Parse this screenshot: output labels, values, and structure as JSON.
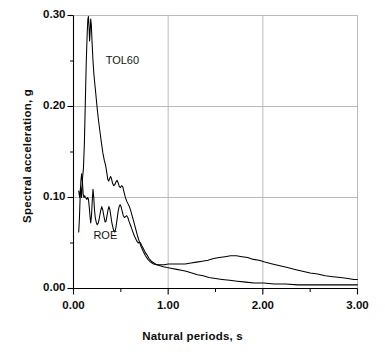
{
  "chart_data": {
    "type": "line",
    "title": "",
    "xlabel": "Natural periods, s",
    "ylabel": "Spectral acceleration, g",
    "xlim": [
      0.0,
      3.0
    ],
    "ylim": [
      0.0,
      0.3
    ],
    "xticks": [
      0.0,
      1.0,
      2.0,
      3.0
    ],
    "xtick_labels": [
      "0.00",
      "1.00",
      "2.00",
      "3.00"
    ],
    "xminorticks": [
      0.5,
      1.5,
      2.5
    ],
    "yticks": [
      0.0,
      0.1,
      0.2,
      0.3
    ],
    "ytick_labels": [
      "0.00",
      "0.10",
      "0.20",
      "0.30"
    ],
    "yminorticks": [
      0.05,
      0.15,
      0.25
    ],
    "grid": true,
    "grid_color": "#b3b3b3",
    "line_color": "#000000",
    "legend_position": "inline-annotations",
    "annotations": [
      {
        "text": "TOL60",
        "x": 0.34,
        "y": 0.249
      },
      {
        "text": "ROE",
        "x": 0.21,
        "y": 0.057
      }
    ],
    "series": [
      {
        "name": "TOL60",
        "color": "#000000",
        "points": [
          [
            0.055,
            0.107
          ],
          [
            0.065,
            0.1
          ],
          [
            0.075,
            0.112
          ],
          [
            0.085,
            0.1
          ],
          [
            0.095,
            0.121
          ],
          [
            0.105,
            0.132
          ],
          [
            0.115,
            0.16
          ],
          [
            0.125,
            0.205
          ],
          [
            0.135,
            0.25
          ],
          [
            0.145,
            0.281
          ],
          [
            0.152,
            0.296
          ],
          [
            0.158,
            0.299
          ],
          [
            0.164,
            0.288
          ],
          [
            0.17,
            0.272
          ],
          [
            0.176,
            0.283
          ],
          [
            0.182,
            0.296
          ],
          [
            0.188,
            0.29
          ],
          [
            0.196,
            0.271
          ],
          [
            0.205,
            0.252
          ],
          [
            0.215,
            0.236
          ],
          [
            0.228,
            0.222
          ],
          [
            0.24,
            0.209
          ],
          [
            0.252,
            0.196
          ],
          [
            0.265,
            0.184
          ],
          [
            0.28,
            0.172
          ],
          [
            0.295,
            0.16
          ],
          [
            0.31,
            0.149
          ],
          [
            0.325,
            0.141
          ],
          [
            0.34,
            0.135
          ],
          [
            0.352,
            0.127
          ],
          [
            0.362,
            0.12
          ],
          [
            0.372,
            0.118
          ],
          [
            0.382,
            0.121
          ],
          [
            0.392,
            0.123
          ],
          [
            0.4,
            0.121
          ],
          [
            0.412,
            0.116
          ],
          [
            0.424,
            0.113
          ],
          [
            0.436,
            0.114
          ],
          [
            0.448,
            0.117
          ],
          [
            0.46,
            0.119
          ],
          [
            0.472,
            0.116
          ],
          [
            0.484,
            0.112
          ],
          [
            0.496,
            0.111
          ],
          [
            0.508,
            0.113
          ],
          [
            0.52,
            0.112
          ],
          [
            0.534,
            0.106
          ],
          [
            0.548,
            0.1
          ],
          [
            0.562,
            0.096
          ],
          [
            0.576,
            0.093
          ],
          [
            0.59,
            0.09
          ],
          [
            0.606,
            0.085
          ],
          [
            0.622,
            0.079
          ],
          [
            0.64,
            0.072
          ],
          [
            0.658,
            0.065
          ],
          [
            0.676,
            0.058
          ],
          [
            0.694,
            0.052
          ],
          [
            0.714,
            0.046
          ],
          [
            0.736,
            0.041
          ],
          [
            0.76,
            0.036
          ],
          [
            0.786,
            0.032
          ],
          [
            0.814,
            0.029
          ],
          [
            0.846,
            0.027
          ],
          [
            0.88,
            0.026
          ],
          [
            0.92,
            0.026
          ],
          [
            0.96,
            0.026
          ],
          [
            1.0,
            0.027
          ],
          [
            1.06,
            0.027
          ],
          [
            1.12,
            0.027
          ],
          [
            1.18,
            0.027
          ],
          [
            1.24,
            0.028
          ],
          [
            1.3,
            0.029
          ],
          [
            1.36,
            0.03
          ],
          [
            1.42,
            0.031
          ],
          [
            1.48,
            0.033
          ],
          [
            1.54,
            0.034
          ],
          [
            1.6,
            0.035
          ],
          [
            1.66,
            0.036
          ],
          [
            1.72,
            0.036
          ],
          [
            1.78,
            0.035
          ],
          [
            1.84,
            0.034
          ],
          [
            1.9,
            0.032
          ],
          [
            1.96,
            0.031
          ],
          [
            2.02,
            0.029
          ],
          [
            2.1,
            0.027
          ],
          [
            2.18,
            0.025
          ],
          [
            2.26,
            0.023
          ],
          [
            2.34,
            0.021
          ],
          [
            2.42,
            0.019
          ],
          [
            2.5,
            0.017
          ],
          [
            2.58,
            0.016
          ],
          [
            2.66,
            0.014
          ],
          [
            2.74,
            0.013
          ],
          [
            2.82,
            0.012
          ],
          [
            2.9,
            0.011
          ],
          [
            2.96,
            0.01
          ],
          [
            3.0,
            0.01
          ]
        ]
      },
      {
        "name": "ROE",
        "color": "#000000",
        "points": [
          [
            0.055,
            0.062
          ],
          [
            0.063,
            0.078
          ],
          [
            0.07,
            0.1
          ],
          [
            0.078,
            0.118
          ],
          [
            0.086,
            0.126
          ],
          [
            0.094,
            0.118
          ],
          [
            0.102,
            0.104
          ],
          [
            0.11,
            0.1
          ],
          [
            0.118,
            0.102
          ],
          [
            0.126,
            0.1
          ],
          [
            0.134,
            0.099
          ],
          [
            0.142,
            0.098
          ],
          [
            0.15,
            0.1
          ],
          [
            0.158,
            0.098
          ],
          [
            0.166,
            0.09
          ],
          [
            0.174,
            0.08
          ],
          [
            0.182,
            0.072
          ],
          [
            0.19,
            0.08
          ],
          [
            0.198,
            0.096
          ],
          [
            0.206,
            0.109
          ],
          [
            0.214,
            0.1
          ],
          [
            0.222,
            0.086
          ],
          [
            0.23,
            0.078
          ],
          [
            0.24,
            0.073
          ],
          [
            0.25,
            0.07
          ],
          [
            0.262,
            0.072
          ],
          [
            0.274,
            0.078
          ],
          [
            0.286,
            0.085
          ],
          [
            0.298,
            0.09
          ],
          [
            0.31,
            0.086
          ],
          [
            0.322,
            0.079
          ],
          [
            0.334,
            0.073
          ],
          [
            0.344,
            0.074
          ],
          [
            0.354,
            0.08
          ],
          [
            0.364,
            0.086
          ],
          [
            0.374,
            0.09
          ],
          [
            0.384,
            0.087
          ],
          [
            0.394,
            0.08
          ],
          [
            0.404,
            0.073
          ],
          [
            0.414,
            0.068
          ],
          [
            0.424,
            0.064
          ],
          [
            0.436,
            0.062
          ],
          [
            0.448,
            0.067
          ],
          [
            0.46,
            0.076
          ],
          [
            0.472,
            0.085
          ],
          [
            0.482,
            0.09
          ],
          [
            0.492,
            0.092
          ],
          [
            0.502,
            0.09
          ],
          [
            0.514,
            0.085
          ],
          [
            0.526,
            0.08
          ],
          [
            0.538,
            0.078
          ],
          [
            0.55,
            0.079
          ],
          [
            0.562,
            0.08
          ],
          [
            0.574,
            0.078
          ],
          [
            0.586,
            0.074
          ],
          [
            0.6,
            0.07
          ],
          [
            0.614,
            0.066
          ],
          [
            0.628,
            0.062
          ],
          [
            0.642,
            0.058
          ],
          [
            0.656,
            0.055
          ],
          [
            0.67,
            0.052
          ],
          [
            0.684,
            0.05
          ],
          [
            0.696,
            0.051
          ],
          [
            0.708,
            0.05
          ],
          [
            0.722,
            0.047
          ],
          [
            0.738,
            0.044
          ],
          [
            0.756,
            0.04
          ],
          [
            0.776,
            0.037
          ],
          [
            0.798,
            0.033
          ],
          [
            0.822,
            0.03
          ],
          [
            0.85,
            0.028
          ],
          [
            0.88,
            0.026
          ],
          [
            0.914,
            0.025
          ],
          [
            0.95,
            0.024
          ],
          [
            0.99,
            0.023
          ],
          [
            1.04,
            0.022
          ],
          [
            1.09,
            0.021
          ],
          [
            1.14,
            0.02
          ],
          [
            1.19,
            0.019
          ],
          [
            1.25,
            0.017
          ],
          [
            1.31,
            0.015
          ],
          [
            1.37,
            0.014
          ],
          [
            1.43,
            0.012
          ],
          [
            1.5,
            0.011
          ],
          [
            1.57,
            0.01
          ],
          [
            1.65,
            0.009
          ],
          [
            1.73,
            0.008
          ],
          [
            1.82,
            0.007
          ],
          [
            1.91,
            0.006
          ],
          [
            2.01,
            0.006
          ],
          [
            2.12,
            0.005
          ],
          [
            2.24,
            0.005
          ],
          [
            2.37,
            0.004
          ],
          [
            2.51,
            0.004
          ],
          [
            2.66,
            0.004
          ],
          [
            2.82,
            0.004
          ],
          [
            3.0,
            0.004
          ]
        ]
      }
    ]
  },
  "caption": {
    "partial_text": ""
  }
}
